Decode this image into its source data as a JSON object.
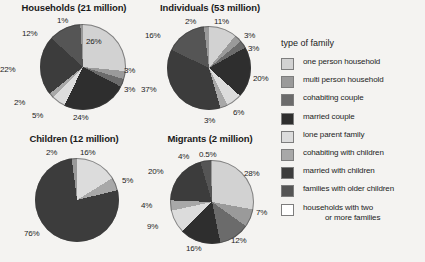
{
  "chart_data": [
    {
      "type": "pie",
      "title": "Households (21 million)",
      "categories": [
        "one person household",
        "multi person household",
        "cohabiting couple",
        "married couple",
        "lone parent family",
        "cohabiting with children",
        "married with children",
        "families with older children",
        "households with two or more families"
      ],
      "values": [
        26,
        3,
        3,
        24,
        5,
        2,
        22,
        12,
        1
      ],
      "labels": [
        "26%",
        "3%",
        "3%",
        "24%",
        "5%",
        "2%",
        "22%",
        "12%",
        "1%"
      ],
      "unit": "percent",
      "legend_position": "right"
    },
    {
      "type": "pie",
      "title": "Individuals (53 million)",
      "categories": [
        "one person household",
        "multi person household",
        "cohabiting couple",
        "married couple",
        "lone parent family",
        "cohabiting with children",
        "married with children",
        "families with older children",
        "households with two or more families"
      ],
      "values": [
        11,
        3,
        3,
        20,
        6,
        3,
        37,
        16,
        2
      ],
      "labels": [
        "11%",
        "3%",
        "3%",
        "20%",
        "6%",
        "3%",
        "37%",
        "16%",
        "2%"
      ],
      "unit": "percent",
      "legend_position": "right"
    },
    {
      "type": "pie",
      "title": "Children (12 million)",
      "categories": [
        "lone parent family",
        "cohabiting with children",
        "married with children",
        "households with two or more families"
      ],
      "values": [
        16,
        5,
        76,
        2
      ],
      "labels": [
        "16%",
        "5%",
        "76%",
        "2%"
      ],
      "unit": "percent",
      "legend_position": "right"
    },
    {
      "type": "pie",
      "title": "Migrants (2 million)",
      "categories": [
        "one person household",
        "multi person household",
        "cohabiting couple",
        "married couple",
        "lone parent family",
        "cohabiting with children",
        "married with children",
        "families with older children",
        "households with two or more families"
      ],
      "values": [
        28,
        7,
        12,
        16,
        9,
        4,
        20,
        4,
        0.5
      ],
      "labels": [
        "28%",
        "7%",
        "12%",
        "16%",
        "9%",
        "4%",
        "20%",
        "4%",
        "0.5%"
      ],
      "unit": "percent",
      "legend_position": "right"
    }
  ],
  "charts": {
    "households": {
      "title": "Households (21 million)",
      "labels": {
        "one_person": "26%",
        "multi_person": "3%",
        "cohabiting_couple": "3%",
        "married_couple": "24%",
        "lone_parent": "5%",
        "cohabiting_children": "2%",
        "married_children": "22%",
        "older_children": "12%",
        "two_or_more": "1%"
      }
    },
    "individuals": {
      "title": "Individuals (53 million)",
      "labels": {
        "one_person": "11%",
        "multi_person": "3%",
        "cohabiting_couple": "3%",
        "married_couple": "20%",
        "lone_parent": "6%",
        "cohabiting_children": "3%",
        "married_children": "37%",
        "older_children": "16%",
        "two_or_more": "2%"
      }
    },
    "children": {
      "title": "Children (12 million)",
      "labels": {
        "lone_parent": "16%",
        "cohabiting_children": "5%",
        "married_children": "76%",
        "two_or_more": "2%"
      }
    },
    "migrants": {
      "title": "Migrants (2 million)",
      "labels": {
        "one_person": "28%",
        "multi_person": "7%",
        "cohabiting_couple": "12%",
        "married_couple": "16%",
        "lone_parent": "9%",
        "cohabiting_children": "4%",
        "married_children": "20%",
        "older_children": "4%",
        "two_or_more": "0.5%"
      }
    }
  },
  "legend": {
    "heading": "type of family",
    "items": [
      {
        "label": "one person household",
        "color": "#d2d2d2"
      },
      {
        "label": "multi person household",
        "color": "#9a9a9a"
      },
      {
        "label": "cohabiting couple",
        "color": "#6b6b6b"
      },
      {
        "label": "married couple",
        "color": "#2e2e2e"
      },
      {
        "label": "lone parent family",
        "color": "#dcdcdc"
      },
      {
        "label": "cohabiting with children",
        "color": "#a8a8a8"
      },
      {
        "label": "married with children",
        "color": "#3c3c3c"
      },
      {
        "label": "families with older children",
        "color": "#555555"
      },
      {
        "label": "households with two",
        "label2": "or more families",
        "color": "#ffffff"
      }
    ]
  }
}
